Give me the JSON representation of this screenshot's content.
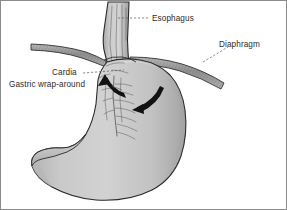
{
  "figure": {
    "background_color": "#ffffff",
    "width": 287,
    "height": 210
  },
  "labels": {
    "esophagus": "Esophagus",
    "diaphragm": "Diaphragm",
    "cardia": "Cardia",
    "gastric_wrap_around": "Gastric wrap-around"
  },
  "structures": {
    "esophagus_name": "esophagus-tube",
    "diaphragm_left_name": "diaphragm-left-band",
    "diaphragm_right_name": "diaphragm-right-band",
    "stomach_name": "stomach-body",
    "fundus_name": "gastric-fundus",
    "cardia_name": "cardia-junction",
    "duodenum_name": "duodenum-pylorus",
    "wrap_left_name": "wrap-arrow-left",
    "wrap_right_name": "wrap-arrow-right",
    "rugae_name": "gastric-rugae"
  },
  "colors": {
    "organ_fill": "#c6c6c6",
    "organ_fill_light": "#d6d6d6",
    "organ_fill_dark": "#a9a9a9",
    "outline": "#2a2a2a",
    "diaphragm_fill": "#9a9a9a",
    "arrow_black": "#121212",
    "text": "#2b2b2b",
    "leader": "#5a5a5a"
  }
}
